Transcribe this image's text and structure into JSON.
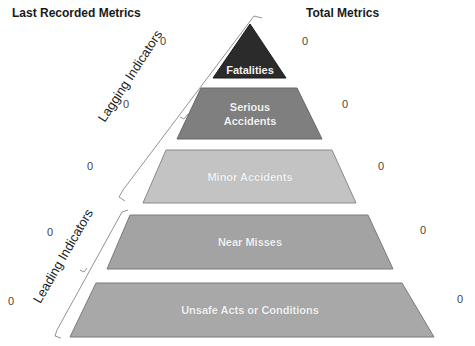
{
  "headers": {
    "left": "Last Recorded Metrics",
    "right": "Total Metrics"
  },
  "brackets": {
    "lagging": "Lagging Indicators",
    "leading": "Leading Indicators"
  },
  "tiers": [
    {
      "label": "Fatalities",
      "last_recorded": "0",
      "total": "0",
      "color": "#2b2b2b"
    },
    {
      "label_line1": "Serious",
      "label_line2": "Accidents",
      "last_recorded": "0",
      "total": "0",
      "color": "#7f7f7f"
    },
    {
      "label": "Minor Accidents",
      "last_recorded": "0",
      "total": "0",
      "color": "#c3c3c3"
    },
    {
      "label": "Near Misses",
      "last_recorded": "0",
      "total": "0",
      "color": "#a3a3a3"
    },
    {
      "label": "Unsafe Acts or Conditions",
      "last_recorded": "0",
      "total": "0",
      "color": "#a8a8a8"
    }
  ]
}
